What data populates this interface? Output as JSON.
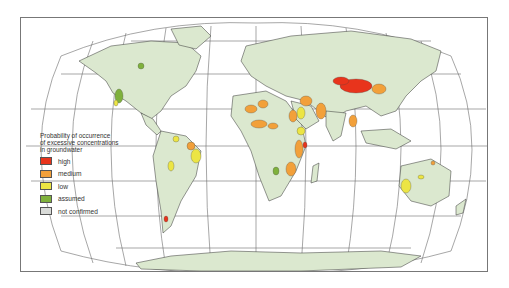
{
  "map": {
    "projection": "Robinson",
    "land_color": "#dbe8cf",
    "coast_color": "#333333",
    "graticule_color": "#666666"
  },
  "legend": {
    "title_line1": "Probability of occurrence",
    "title_line2": "of excessive concentrations",
    "title_line3": "in groundwater",
    "items": [
      {
        "label": "high",
        "color": "#e8341c"
      },
      {
        "label": "medium",
        "color": "#f2a03a"
      },
      {
        "label": "low",
        "color": "#ece544"
      },
      {
        "label": "assumed",
        "color": "#7fb13c"
      },
      {
        "label": "not confirmed",
        "color": "#d9dbd8"
      }
    ]
  }
}
